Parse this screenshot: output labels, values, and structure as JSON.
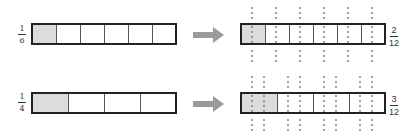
{
  "rows": [
    {
      "left_fraction": {
        "num": "1",
        "den": "6"
      },
      "left_cells": 6,
      "left_shaded": 1,
      "right_fraction": {
        "num": "2",
        "den": "12"
      },
      "right_cells": 6,
      "right_shaded": 1,
      "splits_per_cell": 2
    },
    {
      "left_fraction": {
        "num": "1",
        "den": "4"
      },
      "left_cells": 4,
      "left_shaded": 1,
      "right_fraction": {
        "num": "3",
        "den": "12"
      },
      "right_cells": 4,
      "right_shaded": 1,
      "splits_per_cell": 3
    }
  ],
  "colors": {
    "shaded": "#dcdcdc",
    "arrow": "#999999",
    "border": "#222222",
    "dots": "#777777"
  }
}
